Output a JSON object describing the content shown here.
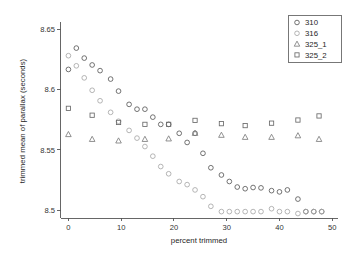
{
  "chart_data": {
    "type": "scatter",
    "title": "",
    "xlabel": "percent trimmed",
    "ylabel": "trimmed mean of parallax (seconds)",
    "xlim": [
      -1.5,
      51
    ],
    "ylim": [
      8.4935,
      8.6545
    ],
    "xticks": [
      0,
      10,
      20,
      30,
      40,
      50
    ],
    "xtick_labels": [
      "0",
      "10",
      "20",
      "30",
      "40",
      "50"
    ],
    "yticks": [
      8.5,
      8.55,
      8.6,
      8.65
    ],
    "ytick_labels": [
      "8.5",
      "8.55",
      "8.6",
      "8.65"
    ],
    "grid": false,
    "legend_position": "top-right",
    "series": [
      {
        "name": "310",
        "marker": "circle",
        "color": "#5a5a5a",
        "points": [
          [
            0,
            8.6168
          ],
          [
            1.5,
            8.6345
          ],
          [
            3,
            8.6262
          ],
          [
            4.5,
            8.6205
          ],
          [
            6,
            8.6158
          ],
          [
            8,
            8.6088
          ],
          [
            9.5,
            8.5988
          ],
          [
            11.5,
            8.5878
          ],
          [
            13,
            8.5838
          ],
          [
            14.5,
            8.5838
          ],
          [
            16,
            8.5772
          ],
          [
            17.5,
            8.5712
          ],
          [
            19,
            8.5712
          ],
          [
            21,
            8.5638
          ],
          [
            22.5,
            8.5562
          ],
          [
            24,
            8.5638
          ],
          [
            25.5,
            8.5472
          ],
          [
            27,
            8.5352
          ],
          [
            29,
            8.5292
          ],
          [
            30.5,
            8.5238
          ],
          [
            32,
            8.5192
          ],
          [
            33.5,
            8.5178
          ],
          [
            35,
            8.5188
          ],
          [
            36.5,
            8.5185
          ],
          [
            38.5,
            8.5162
          ],
          [
            40,
            8.5152
          ],
          [
            41.5,
            8.5168
          ],
          [
            43.5,
            8.5092
          ],
          [
            45,
            8.4988
          ],
          [
            46.5,
            8.4988
          ],
          [
            48,
            8.4988
          ]
        ]
      },
      {
        "name": "316",
        "marker": "circle",
        "color": "#a8a8a8",
        "points": [
          [
            0,
            8.6282
          ],
          [
            1.5,
            8.6198
          ],
          [
            3,
            8.6098
          ],
          [
            4.5,
            8.5995
          ],
          [
            6,
            8.5908
          ],
          [
            8,
            8.5812
          ],
          [
            9.5,
            8.5738
          ],
          [
            11.5,
            8.5662
          ],
          [
            13,
            8.5598
          ],
          [
            14.5,
            8.5528
          ],
          [
            16,
            8.5448
          ],
          [
            17.5,
            8.5362
          ],
          [
            19,
            8.5302
          ],
          [
            21,
            8.5238
          ],
          [
            22.5,
            8.5212
          ],
          [
            24,
            8.5168
          ],
          [
            25.5,
            8.5112
          ],
          [
            27,
            8.5032
          ],
          [
            29,
            8.4988
          ],
          [
            30.5,
            8.4988
          ],
          [
            32,
            8.4988
          ],
          [
            33.5,
            8.4988
          ],
          [
            35,
            8.4988
          ],
          [
            36.5,
            8.4988
          ],
          [
            38.5,
            8.5012
          ],
          [
            40,
            8.4988
          ],
          [
            41.5,
            8.4988
          ],
          [
            43.5,
            8.4972
          ],
          [
            45,
            8.4988
          ],
          [
            46.5,
            8.4988
          ],
          [
            48,
            8.4988
          ]
        ]
      },
      {
        "name": "325_1",
        "marker": "triangle",
        "color": "#7d7d7d",
        "points": [
          [
            0,
            8.5628
          ],
          [
            4.5,
            8.5588
          ],
          [
            9.5,
            8.5575
          ],
          [
            14.5,
            8.5588
          ],
          [
            19,
            8.5592
          ],
          [
            24,
            8.5638
          ],
          [
            29,
            8.5622
          ],
          [
            33.5,
            8.5605
          ],
          [
            38.5,
            8.5605
          ],
          [
            43.5,
            8.5618
          ],
          [
            47.5,
            8.5588
          ]
        ]
      },
      {
        "name": "325_2",
        "marker": "square",
        "color": "#6a6a6a",
        "points": [
          [
            0,
            8.5845
          ],
          [
            4.5,
            8.5788
          ],
          [
            9.5,
            8.5728
          ],
          [
            14.5,
            8.5712
          ],
          [
            19,
            8.5712
          ],
          [
            24,
            8.5745
          ],
          [
            29,
            8.5718
          ],
          [
            33.5,
            8.5702
          ],
          [
            38.5,
            8.5722
          ],
          [
            43.5,
            8.5748
          ],
          [
            47.5,
            8.5782
          ]
        ]
      }
    ]
  },
  "legend": {
    "entries": [
      {
        "label": "310",
        "marker": "circle"
      },
      {
        "label": "316",
        "marker": "circle"
      },
      {
        "label": "325_1",
        "marker": "triangle"
      },
      {
        "label": "325_2",
        "marker": "square"
      }
    ]
  }
}
